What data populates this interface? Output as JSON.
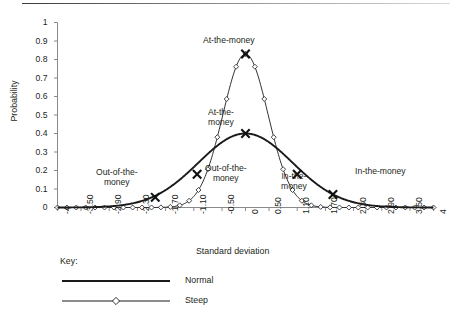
{
  "chart_data": {
    "type": "line",
    "title": "",
    "xlabel": "Standard deviation",
    "ylabel": "Probability",
    "xlim": [
      -4,
      4
    ],
    "ylim": [
      0,
      1
    ],
    "grid": false,
    "legend_position": "below-left",
    "legend_title": "Key:",
    "xticks": [
      -4,
      -3.5,
      -2.9,
      -2.3,
      -1.7,
      -1.1,
      -0.5,
      0,
      0.5,
      1.1,
      1.7,
      2.3,
      2.9,
      3.5,
      4
    ],
    "xtick_labels": [
      "-4",
      "-3.50",
      "-2.90",
      "-2.30",
      "-1.70",
      "-1.10",
      "-0.50",
      "0",
      "0.50",
      "1.10",
      "1.70",
      "2.30",
      "2.90",
      "3.50",
      "4"
    ],
    "yticks": [
      0,
      0.1,
      0.2,
      0.3,
      0.4,
      0.5,
      0.6,
      0.7,
      0.8,
      0.9,
      1
    ],
    "ytick_labels": [
      "0",
      "0.1",
      "0.2",
      "0.3",
      "0.4",
      "0.5",
      "0.6",
      "0.7",
      "0.8",
      "0.9",
      "1"
    ],
    "series": [
      {
        "name": "Normal",
        "marker": "none",
        "line": "solid-thick",
        "color": "#1a1a1a",
        "sigma": 1.0,
        "peak": 0.4,
        "x": [
          -4,
          -3.8,
          -3.6,
          -3.4,
          -3.2,
          -3,
          -2.8,
          -2.6,
          -2.4,
          -2.2,
          -2,
          -1.8,
          -1.6,
          -1.4,
          -1.2,
          -1,
          -0.8,
          -0.6,
          -0.4,
          -0.2,
          0,
          0.2,
          0.4,
          0.6,
          0.8,
          1,
          1.2,
          1.4,
          1.6,
          1.8,
          2,
          2.2,
          2.4,
          2.6,
          2.8,
          3,
          3.2,
          3.4,
          3.6,
          3.8,
          4
        ],
        "y": [
          0.0,
          0.0,
          0.001,
          0.001,
          0.002,
          0.004,
          0.008,
          0.014,
          0.022,
          0.035,
          0.054,
          0.079,
          0.111,
          0.15,
          0.194,
          0.242,
          0.29,
          0.333,
          0.368,
          0.391,
          0.399,
          0.391,
          0.368,
          0.333,
          0.29,
          0.242,
          0.194,
          0.15,
          0.111,
          0.079,
          0.054,
          0.035,
          0.022,
          0.014,
          0.008,
          0.004,
          0.002,
          0.001,
          0.001,
          0.0,
          0.0
        ]
      },
      {
        "name": "Steep",
        "marker": "diamond-open",
        "line": "solid-thin",
        "color": "#1a1a1a",
        "sigma": 0.48,
        "peak": 0.83,
        "x": [
          -4,
          -3.8,
          -3.6,
          -3.4,
          -3.2,
          -3,
          -2.8,
          -2.6,
          -2.4,
          -2.2,
          -2,
          -1.8,
          -1.6,
          -1.4,
          -1.2,
          -1,
          -0.8,
          -0.6,
          -0.4,
          -0.2,
          0,
          0.2,
          0.4,
          0.6,
          0.8,
          1,
          1.2,
          1.4,
          1.6,
          1.8,
          2,
          2.2,
          2.4,
          2.6,
          2.8,
          3,
          3.2,
          3.4,
          3.6,
          3.8,
          4
        ],
        "y": [
          0.0,
          0.0,
          0.0,
          0.0,
          0.0,
          0.0,
          0.0,
          0.0,
          0.0,
          0.0,
          0.0,
          0.001,
          0.004,
          0.015,
          0.043,
          0.103,
          0.205,
          0.345,
          0.505,
          0.657,
          0.83,
          0.657,
          0.505,
          0.345,
          0.205,
          0.103,
          0.043,
          0.015,
          0.004,
          0.001,
          0.0,
          0.0,
          0.0,
          0.0,
          0.0,
          0.0,
          0.0,
          0.0,
          0.0,
          0.0,
          0.0
        ]
      }
    ],
    "annotations": [
      {
        "id": "out-of-the-money-normal",
        "text_lines": [
          "Out-of-the-",
          "money"
        ],
        "marker": "x",
        "x": -1.92,
        "y": 0.055
      },
      {
        "id": "out-of-the-money-steep",
        "text_lines": [
          "Out-of-the-",
          "money"
        ],
        "marker": "x",
        "x": -1.03,
        "y": 0.18
      },
      {
        "id": "at-the-money-steep",
        "text_lines": [
          "At-the-money"
        ],
        "marker": "x",
        "x": 0.0,
        "y": 0.83
      },
      {
        "id": "at-the-money-normal",
        "text_lines": [
          "At-the-",
          "money"
        ],
        "marker": "x",
        "x": 0.0,
        "y": 0.4
      },
      {
        "id": "in-the-money-steep",
        "text_lines": [
          "In-the-",
          "money"
        ],
        "marker": "x",
        "x": 1.1,
        "y": 0.18
      },
      {
        "id": "in-the-money-normal",
        "text_lines": [
          "In-the-money"
        ],
        "marker": "x",
        "x": 1.86,
        "y": 0.07
      }
    ]
  },
  "legend": {
    "title": "Key:",
    "entries": [
      {
        "label": "Normal",
        "style": "solid-thick"
      },
      {
        "label": "Steep",
        "style": "thin-with-diamond"
      }
    ]
  },
  "axes": {
    "y_title": "Probability",
    "x_title": "Standard deviation"
  }
}
